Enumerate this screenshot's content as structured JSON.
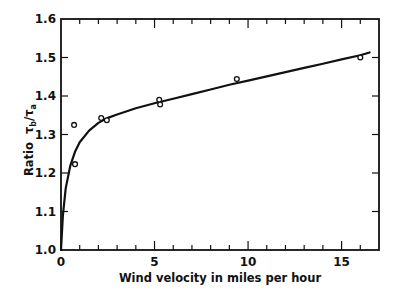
{
  "chart_data": {
    "type": "scatter",
    "title": "",
    "xlabel": "Wind velocity in miles per hour",
    "ylabel": "Ratio",
    "ylabel_symbol": {
      "base": "τ",
      "num_sub": "b",
      "den_sub": "a"
    },
    "xlim": [
      0,
      17
    ],
    "ylim": [
      1.0,
      1.6
    ],
    "x_ticks": [
      0,
      5,
      10,
      15
    ],
    "x_tick_labels": [
      "0",
      "5",
      "10",
      "15"
    ],
    "x_minor_step": 1,
    "y_ticks": [
      1.0,
      1.1,
      1.2,
      1.3,
      1.4,
      1.5,
      1.6
    ],
    "y_tick_labels": [
      "1.0",
      "1.1",
      "1.2",
      "1.3",
      "1.4",
      "1.5",
      "1.6"
    ],
    "grid": false,
    "legend": null,
    "series": [
      {
        "name": "observed",
        "kind": "scatter",
        "marker": "open-circle",
        "points": [
          [
            0.7,
            1.325
          ],
          [
            0.75,
            1.223
          ],
          [
            2.15,
            1.343
          ],
          [
            2.45,
            1.337
          ],
          [
            5.25,
            1.39
          ],
          [
            5.3,
            1.378
          ],
          [
            9.4,
            1.444
          ],
          [
            16.0,
            1.5
          ]
        ]
      },
      {
        "name": "fitted curve",
        "kind": "line",
        "points": [
          [
            0.0,
            1.0
          ],
          [
            0.1,
            1.09
          ],
          [
            0.25,
            1.16
          ],
          [
            0.5,
            1.22
          ],
          [
            0.75,
            1.255
          ],
          [
            1.0,
            1.28
          ],
          [
            1.5,
            1.31
          ],
          [
            2.0,
            1.33
          ],
          [
            2.5,
            1.343
          ],
          [
            3.0,
            1.352
          ],
          [
            4.0,
            1.368
          ],
          [
            5.0,
            1.381
          ],
          [
            6.0,
            1.393
          ],
          [
            7.0,
            1.405
          ],
          [
            8.0,
            1.417
          ],
          [
            9.0,
            1.429
          ],
          [
            10.0,
            1.44
          ],
          [
            11.0,
            1.451
          ],
          [
            12.0,
            1.462
          ],
          [
            13.0,
            1.473
          ],
          [
            14.0,
            1.484
          ],
          [
            15.0,
            1.495
          ],
          [
            16.0,
            1.506
          ],
          [
            16.5,
            1.513
          ]
        ]
      }
    ]
  },
  "plot": {
    "left": 61,
    "right": 379,
    "top": 19,
    "bottom": 250,
    "x_max_axis": 17,
    "stroke": "#111111"
  }
}
